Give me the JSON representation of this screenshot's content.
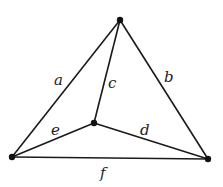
{
  "diagram": {
    "type": "graph",
    "vertices": [
      {
        "id": "top",
        "x": 120,
        "y": 20
      },
      {
        "id": "left",
        "x": 12,
        "y": 157
      },
      {
        "id": "right",
        "x": 208,
        "y": 159
      },
      {
        "id": "center",
        "x": 94,
        "y": 123
      }
    ],
    "edges": [
      {
        "label": "a",
        "from": "left",
        "to": "top",
        "lx": 59,
        "ly": 85
      },
      {
        "label": "b",
        "from": "top",
        "to": "right",
        "lx": 168,
        "ly": 82
      },
      {
        "label": "c",
        "from": "top",
        "to": "center",
        "lx": 109,
        "ly": 87
      },
      {
        "label": "d",
        "from": "center",
        "to": "right",
        "lx": 140,
        "ly": 135
      },
      {
        "label": "e",
        "from": "left",
        "to": "center",
        "lx": 52,
        "ly": 135
      },
      {
        "label": "f",
        "from": "left",
        "to": "right",
        "lx": 99,
        "ly": 177
      }
    ]
  }
}
